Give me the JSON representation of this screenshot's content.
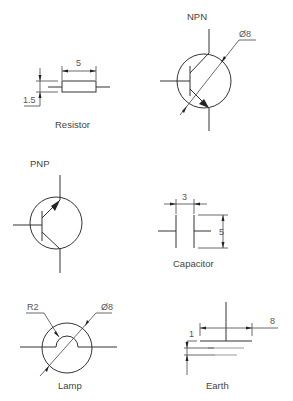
{
  "symbols": {
    "resistor": {
      "label": "Resistor",
      "dim_length": "5",
      "dim_height": "1.5"
    },
    "npn": {
      "label": "NPN",
      "dim_diameter": "Ø8"
    },
    "pnp": {
      "label": "PNP"
    },
    "capacitor": {
      "label": "Capacitor",
      "dim_gap": "3",
      "dim_height": "5"
    },
    "lamp": {
      "label": "Lamp",
      "dim_radius": "R2",
      "dim_diameter": "Ø8"
    },
    "earth": {
      "label": "Earth",
      "dim_spacing": "1",
      "dim_width": "8"
    }
  },
  "colors": {
    "line": "#333333",
    "text": "#444444",
    "background": "#ffffff"
  }
}
